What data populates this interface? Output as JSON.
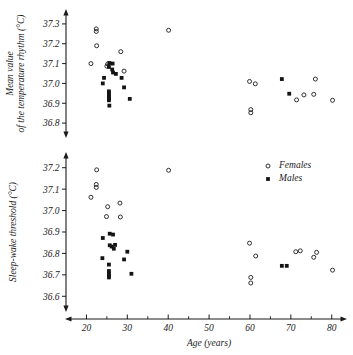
{
  "figure": {
    "xlabel": "Age (years)",
    "legend": {
      "position": "top-right-of-lower-panel",
      "entries": [
        {
          "label": "Females",
          "marker": "open-circle"
        },
        {
          "label": "Males",
          "marker": "filled-square"
        }
      ]
    }
  },
  "chart_data": [
    {
      "type": "scatter",
      "panel": "upper",
      "title": "",
      "xlabel": "Age (years)",
      "ylabel": "Mean value of the temperature rhythm (°C)",
      "ylabel_lines": [
        "Mean value",
        "of the temperature rhythm (°C)"
      ],
      "xlim": [
        15,
        83
      ],
      "ylim": [
        36.75,
        37.35
      ],
      "xticks": [
        20,
        30,
        40,
        50,
        60,
        70,
        80
      ],
      "xticklabels": [
        "20",
        "30",
        "40",
        "50",
        "60",
        "70",
        "80"
      ],
      "xminorticks": [
        25,
        35,
        45,
        55,
        65,
        75
      ],
      "yticks": [
        36.8,
        36.9,
        37.0,
        37.1,
        37.2,
        37.3
      ],
      "yticklabels": [
        "36.8",
        "36.9",
        "37.0",
        "37.1",
        "37.2",
        "37.3"
      ],
      "grid": false,
      "series": [
        {
          "name": "Females",
          "marker": "open-circle",
          "points": [
            [
              22.4,
              37.275
            ],
            [
              22.4,
              37.262
            ],
            [
              22.5,
              37.19
            ],
            [
              21.1,
              37.1
            ],
            [
              25.2,
              37.098
            ],
            [
              25.0,
              37.087
            ],
            [
              28.4,
              37.16
            ],
            [
              29.2,
              37.062
            ],
            [
              40.1,
              37.268
            ],
            [
              59.9,
              37.01
            ],
            [
              61.3,
              36.998
            ],
            [
              60.2,
              36.868
            ],
            [
              60.2,
              36.852
            ],
            [
              71.4,
              36.917
            ],
            [
              73.2,
              36.942
            ],
            [
              75.6,
              36.945
            ],
            [
              76.0,
              37.022
            ],
            [
              80.2,
              36.915
            ]
          ]
        },
        {
          "name": "Males",
          "marker": "filled-square",
          "points": [
            [
              25.6,
              37.103
            ],
            [
              26.4,
              37.1
            ],
            [
              25.5,
              37.083
            ],
            [
              26.3,
              37.07
            ],
            [
              26.5,
              37.055
            ],
            [
              27.2,
              37.048
            ],
            [
              24.3,
              37.028
            ],
            [
              24.0,
              37.0
            ],
            [
              25.5,
              36.96
            ],
            [
              25.5,
              36.95
            ],
            [
              25.5,
              36.94
            ],
            [
              25.5,
              36.93
            ],
            [
              25.5,
              36.922
            ],
            [
              25.5,
              36.915
            ],
            [
              25.6,
              36.888
            ],
            [
              28.6,
              37.028
            ],
            [
              29.2,
              36.98
            ],
            [
              30.6,
              36.922
            ],
            [
              67.8,
              37.022
            ],
            [
              69.6,
              36.948
            ]
          ]
        }
      ]
    },
    {
      "type": "scatter",
      "panel": "lower",
      "title": "",
      "xlabel": "Age (years)",
      "ylabel": "Sleep-wake threshold (°C)",
      "ylabel_lines": [
        "Sleep-wake threshold (°C)"
      ],
      "xlim": [
        15,
        83
      ],
      "ylim": [
        36.55,
        37.25
      ],
      "xticks": [
        20,
        30,
        40,
        50,
        60,
        70,
        80
      ],
      "xticklabels": [
        "20",
        "30",
        "40",
        "50",
        "60",
        "70",
        "80"
      ],
      "xminorticks": [
        25,
        35,
        45,
        55,
        65,
        75
      ],
      "yticks": [
        36.6,
        36.7,
        36.8,
        36.9,
        37.0,
        37.1,
        37.2
      ],
      "yticklabels": [
        "36.6",
        "36.7",
        "36.8",
        "36.9",
        "37.0",
        "37.1",
        "37.2"
      ],
      "grid": false,
      "series": [
        {
          "name": "Females",
          "marker": "open-circle",
          "points": [
            [
              22.5,
              37.19
            ],
            [
              22.4,
              37.122
            ],
            [
              22.4,
              37.108
            ],
            [
              21.1,
              37.062
            ],
            [
              25.2,
              37.018
            ],
            [
              24.9,
              36.972
            ],
            [
              28.2,
              37.035
            ],
            [
              28.3,
              36.97
            ],
            [
              40.1,
              37.188
            ],
            [
              59.9,
              36.848
            ],
            [
              61.4,
              36.788
            ],
            [
              60.2,
              36.688
            ],
            [
              60.2,
              36.662
            ],
            [
              71.2,
              36.808
            ],
            [
              72.3,
              36.812
            ],
            [
              75.6,
              36.782
            ],
            [
              76.3,
              36.805
            ],
            [
              80.2,
              36.722
            ]
          ]
        },
        {
          "name": "Males",
          "marker": "filled-square",
          "points": [
            [
              24.0,
              36.872
            ],
            [
              25.7,
              36.892
            ],
            [
              26.5,
              36.888
            ],
            [
              25.7,
              36.838
            ],
            [
              26.2,
              36.832
            ],
            [
              27.0,
              36.84
            ],
            [
              23.9,
              36.778
            ],
            [
              25.5,
              36.748
            ],
            [
              25.5,
              36.718
            ],
            [
              25.5,
              36.705
            ],
            [
              25.5,
              36.695
            ],
            [
              25.5,
              36.688
            ],
            [
              26.7,
              36.822
            ],
            [
              30.0,
              36.808
            ],
            [
              29.2,
              36.772
            ],
            [
              31.0,
              36.705
            ],
            [
              67.8,
              36.742
            ],
            [
              69.0,
              36.742
            ]
          ]
        }
      ]
    }
  ]
}
